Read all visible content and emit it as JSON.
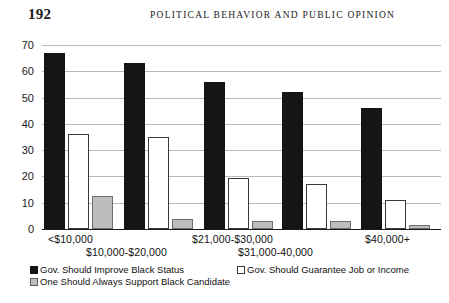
{
  "page": {
    "number": "192",
    "running_head": "POLITICAL BEHAVIOR AND PUBLIC OPINION"
  },
  "chart_data": {
    "type": "bar",
    "title": "",
    "xlabel": "",
    "ylabel": "",
    "ylim": [
      0,
      70
    ],
    "yticks": [
      "0",
      "10",
      "20",
      "30",
      "40",
      "50",
      "60",
      "70"
    ],
    "grid": true,
    "legend_position": "bottom-left",
    "categories": [
      "<$10,000",
      "$10,000-$20,000",
      "$21,000-$30,000",
      "$31,000-40,000",
      "$40,000+"
    ],
    "series": [
      {
        "name": "Gov. Should Improve Black Status",
        "color": "#151515",
        "values": [
          67,
          63,
          56,
          52,
          46
        ]
      },
      {
        "name": "Gov. Should Guarantee Job or Income",
        "color": "#ffffff",
        "values": [
          36,
          35,
          19.5,
          17,
          11
        ]
      },
      {
        "name": "One Should Always Support Black Candidate",
        "color": "#bdbdbd",
        "values": [
          12.5,
          4,
          3,
          3,
          1.5
        ]
      }
    ]
  }
}
